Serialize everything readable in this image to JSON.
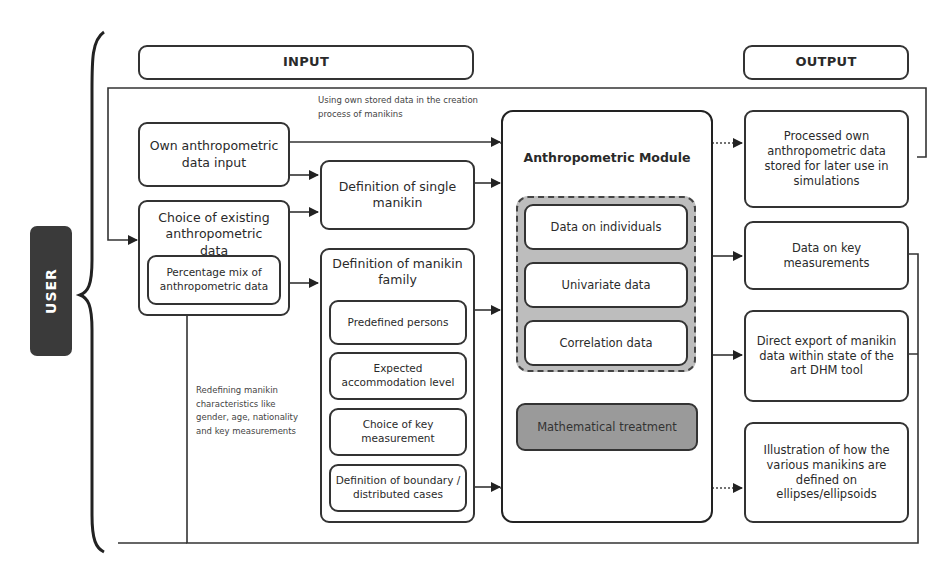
{
  "user_label": "USER",
  "headers": {
    "input": "INPUT",
    "output": "OUTPUT"
  },
  "notes": {
    "top_feedback": "Using own stored data in the creation process of manikins",
    "bottom_feedback": "Redefining manikin characteristics like gender, age, nationality and key measurements"
  },
  "input": {
    "own_data": "Own anthropometric data input",
    "existing_data": "Choice of existing anthropometric data",
    "percentage_mix": "Percentage mix of anthropometric data"
  },
  "definition": {
    "single": "Definition of single manikin",
    "family": "Definition of manikin family",
    "family_items": [
      "Predefined persons",
      "Expected accommodation level",
      "Choice of key measurement",
      "Definition of boundary / distributed cases"
    ]
  },
  "module": {
    "title": "Anthropometric Module",
    "data_items": [
      "Data on individuals",
      "Univariate data",
      "Correlation data"
    ],
    "treatment": "Mathematical treatment"
  },
  "output": {
    "items": [
      "Processed own anthropometric data stored for later use in simulations",
      "Data on key measurements",
      "Direct export of manikin data within state of the art DHM tool",
      "Illustration of how the various manikins are defined on ellipses/ellipsoids"
    ]
  },
  "colors": {
    "line": "#333333",
    "user_bg": "#3a3a3a",
    "data_group_bg": "#bdbdbd",
    "treatment_bg": "#9a9a9a"
  }
}
